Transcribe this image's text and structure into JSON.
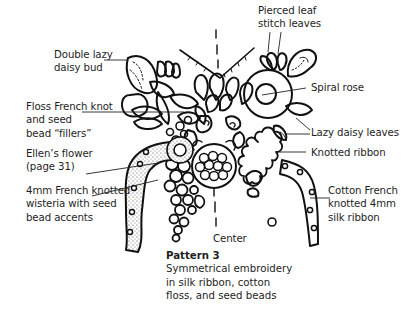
{
  "figure": {
    "title": "Pattern 3",
    "description_lines": [
      "Symmetrical embroidery",
      "in silk ribbon, cotton",
      "floss, and seed beads"
    ],
    "center_label": "Center",
    "line_color": "#111111",
    "text_color": "#1e1e1e",
    "stipple_color": "#555555"
  },
  "labels": {
    "double_lazy_daisy_bud": [
      "Double lazy",
      "daisy bud"
    ],
    "floss_french_knot": [
      "Floss French knot",
      "and seed",
      "bead “fillers”"
    ],
    "ellens_flower": [
      "Ellen’s flower",
      "(page 31)"
    ],
    "wisteria": [
      "4mm French knotted",
      "wisteria with seed",
      "bead accents"
    ],
    "pierced_leaf": [
      "Pierced leaf",
      "stitch leaves"
    ],
    "spiral_rose": [
      "Spiral rose"
    ],
    "lazy_daisy_leaves": [
      "Lazy daisy leaves"
    ],
    "knotted_ribbon": [
      "Knotted ribbon"
    ],
    "cotton_french": [
      "Cotton French",
      "knotted 4mm",
      "silk ribbon"
    ]
  }
}
